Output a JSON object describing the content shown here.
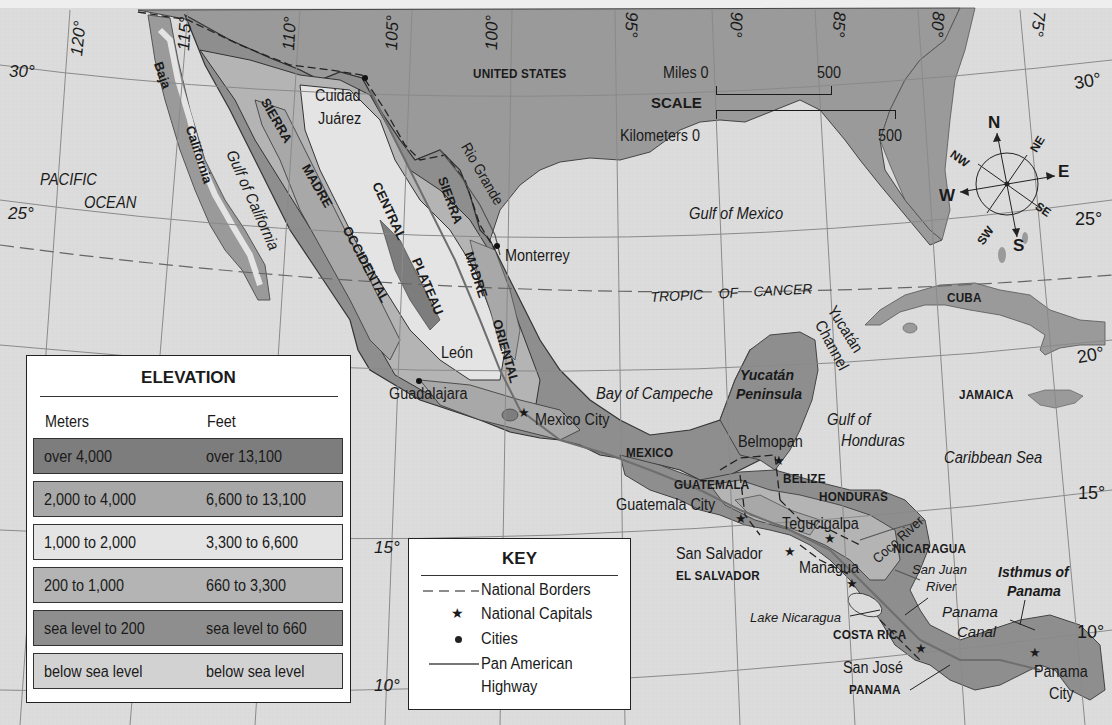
{
  "map": {
    "title": "Mexico and Central America – Physical Map",
    "longitude_labels": [
      "120°",
      "115°",
      "110°",
      "105°",
      "100°",
      "95°",
      "90°",
      "85°",
      "80°",
      "75°"
    ],
    "latitude_labels": {
      "left_30": "30°",
      "left_25": "25°",
      "left_15": "15°",
      "left_10": "10°",
      "right_30": "30°",
      "right_25": "25°",
      "right_20": "20°",
      "right_15": "15°",
      "right_10": "10°"
    },
    "countries": {
      "united_states": "UNITED STATES",
      "mexico": "MEXICO",
      "guatemala": "GUATEMALA",
      "belize": "BELIZE",
      "honduras": "HONDURAS",
      "el_salvador": "EL SALVADOR",
      "nicaragua": "NICARAGUA",
      "costa_rica": "COSTA RICA",
      "panama": "PANAMA",
      "cuba": "CUBA",
      "jamaica": "JAMAICA"
    },
    "cities": {
      "ciudad_juarez_1": "Cuidad",
      "ciudad_juarez_2": "Juárez",
      "monterrey": "Monterrey",
      "leon": "León",
      "guadalajara": "Guadalajara",
      "mexico_city": "Mexico City",
      "belmopan": "Belmopan",
      "guatemala_city": "Guatemala City",
      "tegucigalpa": "Tegucigalpa",
      "san_salvador": "San Salvador",
      "managua": "Managua",
      "san_jose": "San José",
      "panama_city_1": "Panama",
      "panama_city_2": "City"
    },
    "water": {
      "pacific_1": "PACIFIC",
      "pacific_2": "OCEAN",
      "gulf_of_california": "Gulf of California",
      "gulf_of_mexico": "Gulf of Mexico",
      "bay_of_campeche": "Bay of Campeche",
      "gulf_of_honduras_1": "Gulf of",
      "gulf_of_honduras_2": "Honduras",
      "caribbean_sea": "Caribbean Sea",
      "yucatan_channel_1": "Yucatán",
      "yucatan_channel_2": "Channel",
      "rio_grande": "Rio Grande",
      "coco_river": "Coco River",
      "san_juan_river_1": "San Juan",
      "san_juan_river_2": "River",
      "lake_nicaragua": "Lake Nicaragua",
      "panama_canal_1": "Panama",
      "panama_canal_2": "Canal"
    },
    "landforms": {
      "baja": "Baja",
      "california": "California",
      "sierra_occ_1": "SIERRA",
      "sierra_occ_2": "MADRE",
      "sierra_occ_3": "OCCIDENTAL",
      "central_1": "CENTRAL",
      "central_2": "PLATEAU",
      "sierra_or_1": "SIERRA",
      "sierra_or_2": "MADRE",
      "sierra_or_3": "ORIENTAL",
      "yucatan_pen_1": "Yucatán",
      "yucatan_pen_2": "Peninsula",
      "isthmus_1": "Isthmus of",
      "isthmus_2": "Panama"
    },
    "tropic": "TROPIC    OF    CANCER",
    "colors": {
      "ocean": "#dcdcdc",
      "us_land": "#9a9a9a",
      "over_4000": "#7d7d7d",
      "m2000_4000": "#a8a8a8",
      "m1000_2000": "#e4e4e4",
      "m200_1000": "#b4b4b4",
      "sea_to_200": "#8e8e8e",
      "below_sea": "#d2d2d2"
    }
  },
  "scale": {
    "title": "SCALE",
    "miles_label": "Miles 0",
    "miles_max": "500",
    "km_label": "Kilometers 0",
    "km_max": "500"
  },
  "compass": {
    "n": "N",
    "ne": "NE",
    "e": "E",
    "se": "SE",
    "s": "S",
    "sw": "SW",
    "w": "W",
    "nw": "NW"
  },
  "elevation_legend": {
    "title": "ELEVATION",
    "col_meters": "Meters",
    "col_feet": "Feet",
    "rows": [
      {
        "meters": "over 4,000",
        "feet": "over 13,100",
        "color": "#7d7d7d"
      },
      {
        "meters": "2,000 to 4,000",
        "feet": "6,600 to 13,100",
        "color": "#a8a8a8"
      },
      {
        "meters": "1,000 to 2,000",
        "feet": "3,300 to 6,600",
        "color": "#e4e4e4"
      },
      {
        "meters": "200 to 1,000",
        "feet": "660 to 3,300",
        "color": "#b4b4b4"
      },
      {
        "meters": "sea level to 200",
        "feet": "sea level to 660",
        "color": "#8e8e8e"
      },
      {
        "meters": "below sea level",
        "feet": "below sea level",
        "color": "#d2d2d2"
      }
    ]
  },
  "key_legend": {
    "title": "KEY",
    "items": [
      {
        "label": "National Borders",
        "symbol": "dashed-line"
      },
      {
        "label": "National Capitals",
        "symbol": "star"
      },
      {
        "label": "Cities",
        "symbol": "dot"
      },
      {
        "label": "Pan American",
        "symbol": "solid-line"
      },
      {
        "label": "Highway",
        "symbol": "none"
      }
    ]
  }
}
